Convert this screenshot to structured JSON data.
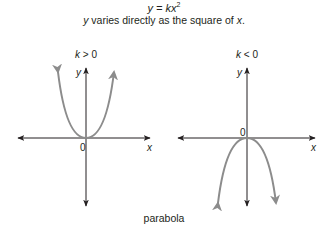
{
  "header": {
    "equation_lhs": "y = kx",
    "equation_exp": "2",
    "description_prefix": "",
    "description_y": "y",
    "description_mid": " varies directly as the square of ",
    "description_x": "x",
    "description_end": "."
  },
  "graphs": [
    {
      "condition": "k > 0",
      "x_label": "x",
      "y_label": "y",
      "origin_label": "0",
      "opens": "up"
    },
    {
      "condition": "k < 0",
      "x_label": "x",
      "y_label": "y",
      "origin_label": "0",
      "opens": "down"
    }
  ],
  "caption": "parabola",
  "colors": {
    "axis": "#231f20",
    "curve": "#8c8c8c"
  }
}
